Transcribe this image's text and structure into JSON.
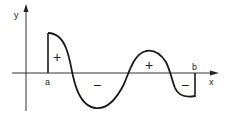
{
  "diagram": {
    "colors": {
      "stroke": "#1a1a1a",
      "axis": "#333333",
      "background": "#ffffff"
    },
    "axes": {
      "x_label": "x",
      "y_label": "y"
    },
    "bounds": {
      "a_label": "a",
      "b_label": "b"
    },
    "regions": [
      {
        "id": "r1",
        "sign": "+"
      },
      {
        "id": "r2",
        "sign": "−"
      },
      {
        "id": "r3",
        "sign": "+"
      },
      {
        "id": "r4",
        "sign": "−"
      }
    ]
  }
}
